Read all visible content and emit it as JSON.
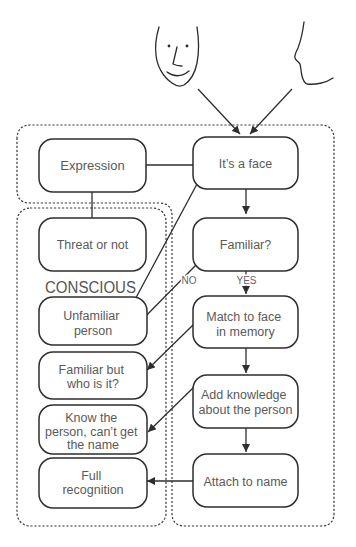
{
  "figure": {
    "faces": [
      {
        "id": "frontal-face",
        "icon": "frontal-face-sketch"
      },
      {
        "id": "profile-face",
        "icon": "profile-face-sketch"
      }
    ],
    "regions": {
      "conscious_label": "CONSCIOUS"
    },
    "nodes": {
      "its_a_face": [
        "It’s a face"
      ],
      "expression": [
        "Expression"
      ],
      "threat_or_not": [
        "Threat or not"
      ],
      "familiar_q": [
        "Familiar?"
      ],
      "unfamiliar_person": [
        "Unfamiliar",
        "person"
      ],
      "match_to_face": [
        "Match to face",
        "in memory"
      ],
      "familiar_but_who": [
        "Familiar but",
        "who is it?"
      ],
      "add_knowledge": [
        "Add knowledge",
        "about the person"
      ],
      "know_the_person": [
        "Know the",
        "person, can’t get",
        "the name"
      ],
      "attach_to_name": [
        "Attach to name"
      ],
      "full_recognition": [
        "Full",
        "recognition"
      ]
    },
    "edge_labels": {
      "no": "NO",
      "yes": "YES"
    },
    "edges": [
      {
        "from": "frontal-face",
        "to": "its_a_face"
      },
      {
        "from": "profile-face",
        "to": "its_a_face"
      },
      {
        "from": "its_a_face",
        "to": "expression"
      },
      {
        "from": "expression",
        "to": "threat_or_not"
      },
      {
        "from": "its_a_face",
        "to": "familiar_q"
      },
      {
        "from": "its_a_face",
        "to": "unfamiliar_person"
      },
      {
        "from": "familiar_q",
        "to": "unfamiliar_person",
        "label": "NO"
      },
      {
        "from": "familiar_q",
        "to": "match_to_face",
        "label": "YES"
      },
      {
        "from": "match_to_face",
        "to": "familiar_but_who"
      },
      {
        "from": "match_to_face",
        "to": "add_knowledge"
      },
      {
        "from": "add_knowledge",
        "to": "know_the_person"
      },
      {
        "from": "add_knowledge",
        "to": "attach_to_name"
      },
      {
        "from": "attach_to_name",
        "to": "full_recognition"
      }
    ]
  }
}
